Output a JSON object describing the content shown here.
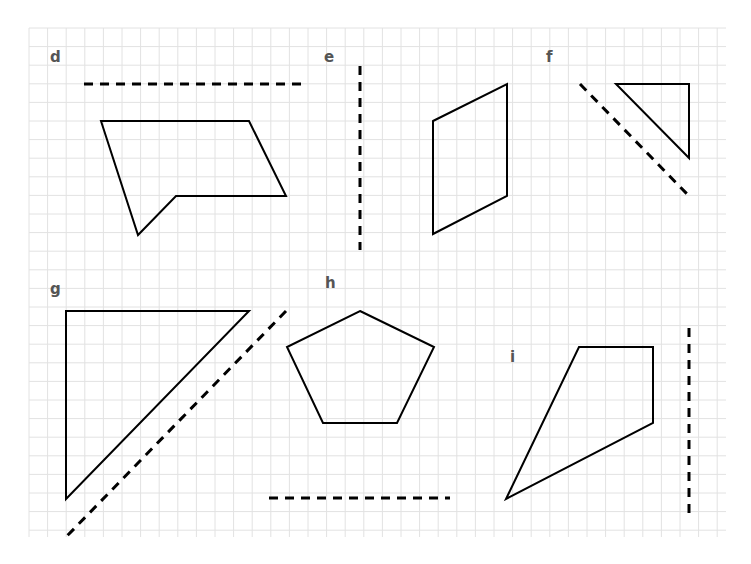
{
  "worksheet": {
    "title": "Reflection exercises",
    "grid": {
      "x0": 29,
      "y0": 28,
      "x1": 726,
      "y1": 537,
      "cell": 18.6,
      "color": "#e2e2e2"
    },
    "stroke_color": "#000000",
    "label_color": "#555555"
  },
  "problems": [
    {
      "id": "d",
      "label": "d",
      "label_pos": [
        50,
        62
      ],
      "shape": [
        [
          101,
          121
        ],
        [
          249,
          121
        ],
        [
          286,
          196
        ],
        [
          176,
          196
        ],
        [
          138,
          235
        ]
      ],
      "mirror": [
        [
          84,
          84
        ],
        [
          305,
          84
        ]
      ]
    },
    {
      "id": "e",
      "label": "e",
      "label_pos": [
        324,
        62
      ],
      "shape": [
        [
          433,
          121
        ],
        [
          507,
          84
        ],
        [
          507,
          196
        ],
        [
          433,
          234
        ]
      ],
      "mirror": [
        [
          360,
          66
        ],
        [
          360,
          250
        ]
      ]
    },
    {
      "id": "f",
      "label": "f",
      "label_pos": [
        546,
        62
      ],
      "shape": [
        [
          616,
          84
        ],
        [
          689,
          84
        ],
        [
          689,
          158
        ]
      ],
      "mirror": [
        [
          580,
          84
        ],
        [
          689,
          196
        ]
      ]
    },
    {
      "id": "g",
      "label": "g",
      "label_pos": [
        50,
        294
      ],
      "shape": [
        [
          66,
          311
        ],
        [
          249,
          311
        ],
        [
          66,
          499
        ]
      ],
      "mirror": [
        [
          286,
          311
        ],
        [
          66,
          537
        ]
      ]
    },
    {
      "id": "h",
      "label": "h",
      "label_pos": [
        325,
        288
      ],
      "shape": [
        [
          360,
          311
        ],
        [
          434,
          347
        ],
        [
          397,
          423
        ],
        [
          323,
          423
        ],
        [
          287,
          347
        ]
      ],
      "mirror": [
        [
          269,
          498
        ],
        [
          450,
          498
        ]
      ]
    },
    {
      "id": "i",
      "label": "i",
      "label_pos": [
        510,
        362
      ],
      "shape": [
        [
          579,
          347
        ],
        [
          653,
          347
        ],
        [
          653,
          423
        ],
        [
          506,
          499
        ]
      ],
      "mirror": [
        [
          689,
          328
        ],
        [
          689,
          515
        ]
      ]
    }
  ]
}
